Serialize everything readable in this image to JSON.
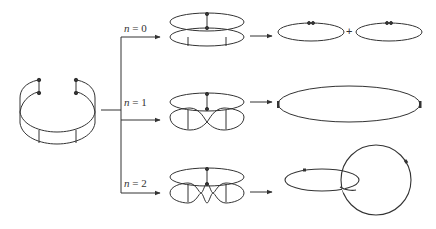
{
  "diagram": {
    "type": "band-cutting-diagram",
    "stroke_color": "#333333",
    "background": "#ffffff",
    "source": {
      "label": "open cylindrical band with marked endpoints"
    },
    "branches": [
      {
        "var": "n",
        "eq": " = ",
        "value": "0",
        "label": "n = 0",
        "twists": 0,
        "result": "two separate loops",
        "result_joiner": "+"
      },
      {
        "var": "n",
        "eq": " = ",
        "value": "1",
        "label": "n = 1",
        "twists": 1,
        "result": "one large loop"
      },
      {
        "var": "n",
        "eq": " = ",
        "value": "2",
        "label": "n = 2",
        "twists": 2,
        "result": "two linked loops"
      }
    ]
  }
}
